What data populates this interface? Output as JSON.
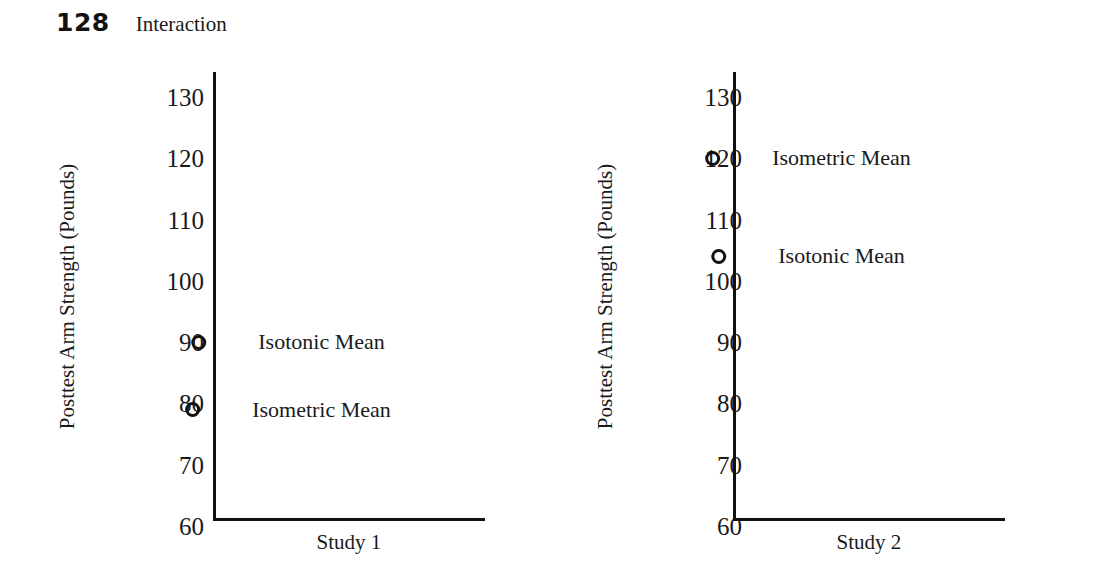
{
  "header": {
    "page_number": "128",
    "running_head": "Interaction"
  },
  "chart_data": [
    {
      "type": "scatter",
      "panel_id": "study-1",
      "title": "Study 1",
      "xlabel": "Study 1",
      "ylabel": "Posttest Arm Strength (Pounds)",
      "ylim": [
        55,
        135
      ],
      "yticks": [
        130,
        120,
        110,
        100,
        90,
        80,
        70,
        60
      ],
      "ytick_labels": [
        "130",
        "120",
        "110",
        "100",
        "90",
        "80",
        "70",
        "60"
      ],
      "grid": false,
      "legend": "inline-labels",
      "points": [
        {
          "label": "Isotonic Mean",
          "value": 90
        },
        {
          "label": "Isometric Mean",
          "value": 79
        }
      ]
    },
    {
      "type": "scatter",
      "panel_id": "study-2",
      "title": "Study 2",
      "xlabel": "Study 2",
      "ylabel": "Posttest Arm Strength (Pounds)",
      "ylim": [
        55,
        135
      ],
      "yticks": [
        130,
        120,
        110,
        100,
        90,
        80,
        70,
        60
      ],
      "ytick_labels": [
        "130",
        "120",
        "110",
        "100",
        "90",
        "80",
        "70",
        "60"
      ],
      "grid": false,
      "legend": "inline-labels",
      "points": [
        {
          "label": "Isometric Mean",
          "value": 120
        },
        {
          "label": "Isotonic Mean",
          "value": 104
        }
      ]
    }
  ],
  "colors": {
    "ink": "#1a1a1a",
    "axis": "#111111",
    "background": "#ffffff"
  }
}
